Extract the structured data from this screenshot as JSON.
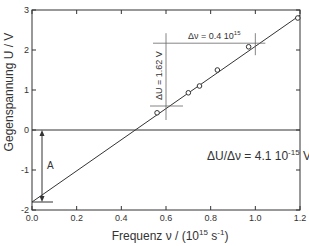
{
  "chart_data": {
    "type": "scatter",
    "title": "",
    "xlabel": "Frequenz ν / (10",
    "xlabel_sup": "15",
    "xlabel_mid": " s",
    "xlabel_sup2": "-1",
    "xlabel_end": ")",
    "ylabel": "Gegenspannung U / V",
    "xlim": [
      0,
      1.2
    ],
    "ylim": [
      -2,
      3
    ],
    "x_ticks": [
      "0.0",
      "0.2",
      "0.4",
      "0.6",
      "0.8",
      "1.0",
      "1.2"
    ],
    "y_ticks": [
      "-2",
      "-1",
      "0",
      "1",
      "2",
      "3"
    ],
    "grid": false,
    "series": [
      {
        "name": "Messwerte",
        "marker": "open-circle",
        "points": [
          [
            0.56,
            0.43
          ],
          [
            0.7,
            0.93
          ],
          [
            0.75,
            1.1
          ],
          [
            0.83,
            1.5
          ],
          [
            0.97,
            2.08
          ],
          [
            1.19,
            2.8
          ]
        ]
      },
      {
        "name": "Ausgleichsgerade",
        "type": "line",
        "points": [
          [
            0.0,
            -1.8
          ],
          [
            1.2,
            2.87
          ]
        ]
      }
    ],
    "reference_lines": {
      "zero_line_y": 0,
      "intercept_y": -1.8
    },
    "annotations": {
      "delta_nu": "Δν = 0.4 10",
      "delta_nu_sup": "15",
      "delta_u": "ΔU = 1.62 V",
      "slope_prefix": "ΔU/Δν = 4.1 10",
      "slope_sup": "-15",
      "slope_suffix": " Vs",
      "intercept_label": "A"
    }
  }
}
